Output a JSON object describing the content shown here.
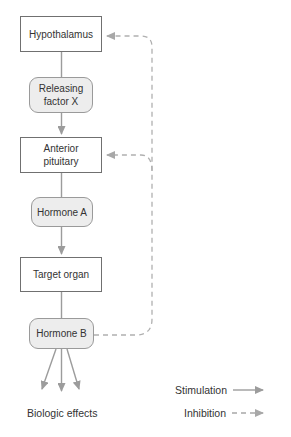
{
  "nodes": [
    {
      "id": "hypothalamus",
      "label": "Hypothalamus",
      "shape": "rect"
    },
    {
      "id": "releasing-factor-x",
      "label": "Releasing factor X",
      "shape": "rounded"
    },
    {
      "id": "anterior-pituitary",
      "label": "Anterior pituitary",
      "shape": "rect"
    },
    {
      "id": "hormone-a",
      "label": "Hormone A",
      "shape": "rounded"
    },
    {
      "id": "target-organ",
      "label": "Target organ",
      "shape": "rect"
    },
    {
      "id": "hormone-b",
      "label": "Hormone B",
      "shape": "rounded"
    }
  ],
  "edges": [
    {
      "from": "hypothalamus",
      "to": "releasing-factor-x",
      "type": "flow"
    },
    {
      "from": "releasing-factor-x",
      "to": "anterior-pituitary",
      "type": "stimulation"
    },
    {
      "from": "anterior-pituitary",
      "to": "hormone-a",
      "type": "flow"
    },
    {
      "from": "hormone-a",
      "to": "target-organ",
      "type": "stimulation"
    },
    {
      "from": "target-organ",
      "to": "hormone-b",
      "type": "flow"
    },
    {
      "from": "hormone-b",
      "to": "biologic-effects",
      "type": "stimulation",
      "count": 3
    },
    {
      "from": "hormone-b",
      "to": "hypothalamus",
      "type": "inhibition"
    },
    {
      "from": "hormone-b",
      "to": "anterior-pituitary",
      "type": "inhibition"
    }
  ],
  "effects_label": "Biologic effects",
  "legend": {
    "stimulation": "Stimulation",
    "inhibition": "Inhibition"
  },
  "colors": {
    "background": "#ffffff",
    "rect_fill": "#ffffff",
    "rect_border": "#707070",
    "rounded_fill": "#ededed",
    "rounded_border": "#9a9a9a",
    "text": "#333333",
    "stimulation_arrow": "#9c9c9c",
    "inhibition_arrow": "#b0b0b0"
  }
}
